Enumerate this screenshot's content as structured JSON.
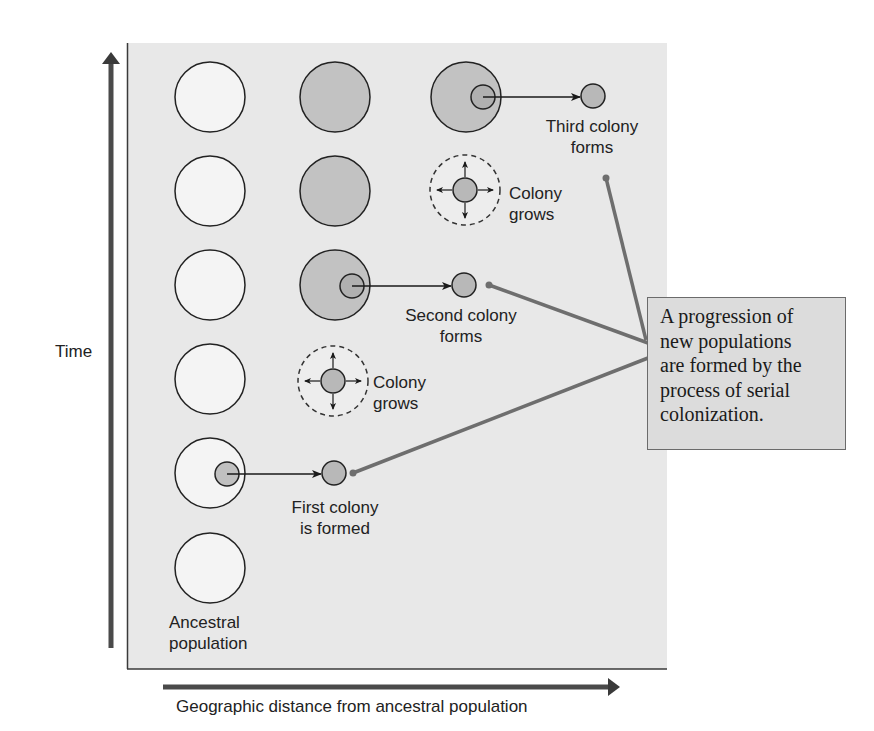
{
  "diagram": {
    "title": "Serial colonization",
    "axes": {
      "y_label": "Time",
      "x_label": "Geographic distance from ancestral population"
    },
    "labels": {
      "ancestral": [
        "Ancestral",
        "population"
      ],
      "first_colony": [
        "First colony",
        "is formed"
      ],
      "colony_grows_1": [
        "Colony",
        "grows"
      ],
      "second_colony": [
        "Second colony",
        "forms"
      ],
      "colony_grows_2": [
        "Colony",
        "grows"
      ],
      "third_colony": [
        "Third colony",
        "forms"
      ]
    },
    "callout": {
      "lines": [
        "A progression of",
        "new populations",
        "are formed by the",
        "process of serial",
        "colonization."
      ]
    },
    "colors": {
      "panel_bg": "#e8e8e8",
      "population_fill_white": "#f7f7f7",
      "population_fill_gray": "#c2c2c2",
      "colony_fill": "#b8b8b8",
      "leader_line": "#6e6e6e",
      "axis_arrow": "#4a4a4a",
      "callout_bg": "#dcdcdc"
    },
    "nodes": [
      {
        "id": "pop-c1-r1",
        "col": 1,
        "row": 1,
        "type": "ancestral-white"
      },
      {
        "id": "pop-c1-r2",
        "col": 1,
        "row": 2,
        "type": "ancestral-white"
      },
      {
        "id": "pop-c1-r3",
        "col": 1,
        "row": 3,
        "type": "ancestral-white"
      },
      {
        "id": "pop-c1-r4",
        "col": 1,
        "row": 4,
        "type": "ancestral-white"
      },
      {
        "id": "pop-c1-r5",
        "col": 1,
        "row": 5,
        "type": "ancestral-white-with-emigrant"
      },
      {
        "id": "pop-c1-r6",
        "col": 1,
        "row": 6,
        "type": "ancestral-white"
      },
      {
        "id": "colony-1",
        "col": 2,
        "row": 5,
        "type": "small-colony"
      },
      {
        "id": "grow-1",
        "col": 2,
        "row": 4,
        "type": "colony-growing"
      },
      {
        "id": "pop-c2-r3",
        "col": 2,
        "row": 3,
        "type": "gray-with-emigrant"
      },
      {
        "id": "pop-c2-r2",
        "col": 2,
        "row": 2,
        "type": "gray"
      },
      {
        "id": "pop-c2-r1",
        "col": 2,
        "row": 1,
        "type": "gray"
      },
      {
        "id": "colony-2",
        "col": 3,
        "row": 3,
        "type": "small-colony"
      },
      {
        "id": "grow-2",
        "col": 3,
        "row": 2,
        "type": "colony-growing"
      },
      {
        "id": "pop-c3-r1",
        "col": 3,
        "row": 1,
        "type": "gray-with-emigrant"
      },
      {
        "id": "colony-3",
        "col": 4,
        "row": 1,
        "type": "small-colony"
      }
    ]
  }
}
